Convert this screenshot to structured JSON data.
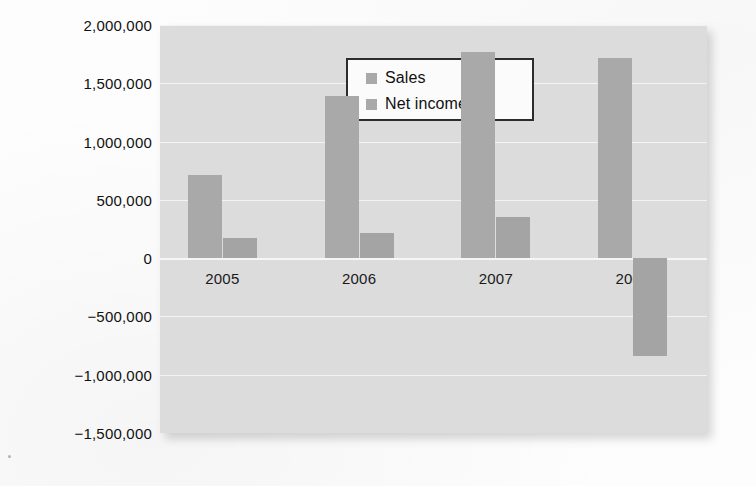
{
  "chart_data": {
    "type": "bar",
    "title": "",
    "subtitle": "",
    "xlabel": "",
    "ylabel": "",
    "categories": [
      "2005",
      "2006",
      "2007",
      "2008"
    ],
    "series": [
      {
        "name": "Sales",
        "values": [
          710000,
          1390000,
          1770000,
          1720000
        ]
      },
      {
        "name": "Net income",
        "values": [
          170000,
          215000,
          355000,
          -840000
        ]
      }
    ],
    "ylim": [
      -1500000,
      2000000
    ],
    "yticks": [
      2000000,
      1500000,
      1000000,
      500000,
      0,
      -500000,
      -1000000,
      -1500000
    ],
    "ytick_labels": [
      "2,000,000",
      "1,500,000",
      "1,000,000",
      "500,000",
      "0",
      "−500,000",
      "−1,000,000",
      "−1,500,000"
    ],
    "xtick_labels": [
      "2005",
      "2006",
      "2007",
      "2008"
    ],
    "grid": true,
    "legend_position": "top-left-inside",
    "legend_entries": [
      "Sales",
      "Net income"
    ],
    "colors": {
      "sales_bar": "#a9a9a9",
      "net_income_bar": "#a4a4a4",
      "plot_background": "#dcdcdc",
      "gridline": "#f3f3f3",
      "page_background": "#fdfdfd",
      "legend_background": "#fbfbfb",
      "legend_border": "#2c2c2c",
      "text": "#111111"
    }
  }
}
